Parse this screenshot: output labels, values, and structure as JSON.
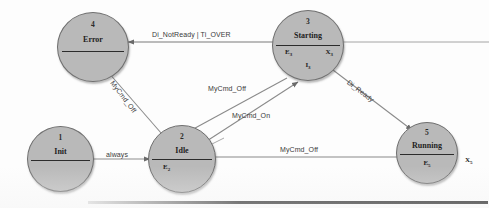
{
  "diagram": {
    "type": "state-machine",
    "title": "",
    "states": [
      {
        "id": "1",
        "name": "Init",
        "entry": "",
        "exit": "",
        "invariant": ""
      },
      {
        "id": "2",
        "name": "Idle",
        "entry": "E2",
        "exit": "",
        "invariant": ""
      },
      {
        "id": "3",
        "name": "Starting",
        "entry": "E3",
        "exit": "X3",
        "invariant": "I3"
      },
      {
        "id": "4",
        "name": "Error",
        "entry": "",
        "exit": "",
        "invariant": ""
      },
      {
        "id": "5",
        "name": "Running",
        "entry": "E5",
        "exit": "X5",
        "invariant": ""
      }
    ],
    "transitions": [
      {
        "from": "1",
        "to": "2",
        "label": "always"
      },
      {
        "from": "3",
        "to": "4",
        "label": "Di_NotReady | Ti_OVER"
      },
      {
        "from": "4",
        "to": "2",
        "label": "MyCmd_Off"
      },
      {
        "from": "3",
        "to": "2",
        "label": "MyCmd_Off"
      },
      {
        "from": "2",
        "to": "3",
        "label": "MyCmd_On"
      },
      {
        "from": "3",
        "to": "5",
        "label": "Di_Ready"
      },
      {
        "from": "5",
        "to": "2",
        "label": "MyCmd_Off"
      }
    ],
    "labels": {
      "always": "always",
      "di_notready_ti_over": "Di_NotReady | Ti_OVER",
      "mycmd_off_error": "MyCmd_Off",
      "mycmd_off_starting": "MyCmd_Off",
      "mycmd_on": "MyCmd_On",
      "di_ready": "Di_Ready",
      "mycmd_off_running": "MyCmd_Off"
    },
    "slots": {
      "idle_entry": "E",
      "idle_entry_sub": "2",
      "starting_entry": "E",
      "starting_entry_sub": "3",
      "starting_exit": "X",
      "starting_exit_sub": "3",
      "starting_inv": "I",
      "starting_inv_sub": "3",
      "running_entry": "E",
      "running_entry_sub": "5",
      "running_exit": "X",
      "running_exit_sub": "5"
    },
    "colors": {
      "node_fill": "#b9b9b9",
      "node_stroke": "#6f6f6f",
      "edge_stroke": "#7a7a7a",
      "text": "#222222",
      "background": "#fdfdfd"
    }
  }
}
